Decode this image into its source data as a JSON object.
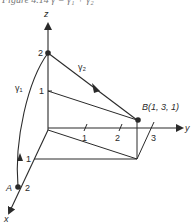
{
  "caption": {
    "text": "Figure 4.14  γ = γ₁ + γ₂"
  },
  "axes": {
    "x": {
      "label": "x",
      "ticks": [
        "1",
        "2"
      ]
    },
    "y": {
      "label": "y",
      "ticks": [
        "1",
        "2",
        "3"
      ]
    },
    "z": {
      "label": "z",
      "ticks": [
        "1",
        "2"
      ]
    }
  },
  "points": {
    "A": {
      "label": "A",
      "coord_label": "2"
    },
    "B": {
      "label": "B(1, 3, 1)"
    }
  },
  "curves": {
    "gamma1": {
      "label": "γ₁"
    },
    "gamma2": {
      "label": "γ₂"
    }
  },
  "colors": {
    "line": "#2a2a2a",
    "background": "#ffffff"
  }
}
